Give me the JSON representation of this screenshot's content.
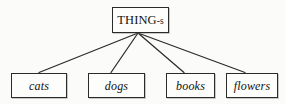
{
  "diagram": {
    "type": "tree-hierarchy",
    "background_color": "#fbfbfa",
    "line_color": "#2b2b2b",
    "box_border_color": "#2b2b2b",
    "box_fill_color": "#fdfdfc",
    "text_color": "#121212",
    "root": {
      "id": "root",
      "label_main": "THING",
      "label_suffix": "-s",
      "label_full": "THING-s",
      "style": "uppercase-roman"
    },
    "leaves": [
      {
        "id": "cats",
        "label": "cats",
        "style": "italic"
      },
      {
        "id": "dogs",
        "label": "dogs",
        "style": "italic"
      },
      {
        "id": "books",
        "label": "books",
        "style": "italic"
      },
      {
        "id": "flowers",
        "label": "flowers",
        "style": "italic"
      }
    ],
    "edges": [
      {
        "from": "root",
        "to": "cats"
      },
      {
        "from": "root",
        "to": "dogs"
      },
      {
        "from": "root",
        "to": "books"
      },
      {
        "from": "root",
        "to": "flowers"
      }
    ]
  }
}
